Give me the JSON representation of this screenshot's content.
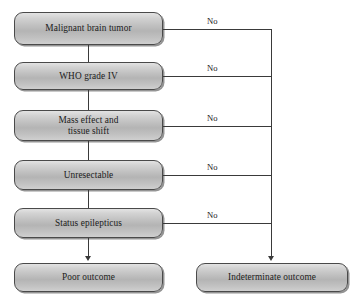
{
  "diagram": {
    "type": "flowchart",
    "canvas": {
      "width": 353,
      "height": 302,
      "background": "#ffffff"
    },
    "style": {
      "node_fill_light": "#e3e3e3",
      "node_fill_mid": "#b4b4b4",
      "node_border": "#4a4a4a",
      "edge_color": "#3a3a3a",
      "text_color": "#1b1b1b"
    },
    "nodes": [
      {
        "id": "n1",
        "label": "Malignant brain tumor",
        "line1": "Malignant brain tumor",
        "line2": ""
      },
      {
        "id": "n2",
        "label": "WHO grade IV",
        "line1": "WHO grade IV",
        "line2": ""
      },
      {
        "id": "n3",
        "label": "Mass effect and tissue shift",
        "line1": "Mass effect and",
        "line2": "tissue shift"
      },
      {
        "id": "n4",
        "label": "Unresectable",
        "line1": "Unresectable",
        "line2": ""
      },
      {
        "id": "n5",
        "label": "Status epilepticus",
        "line1": "Status epilepticus",
        "line2": ""
      },
      {
        "id": "n6",
        "label": "Poor outcome",
        "line1": "Poor outcome",
        "line2": ""
      },
      {
        "id": "n7",
        "label": "Indeterminate outcome",
        "line1": "Indeterminate outcome",
        "line2": ""
      }
    ],
    "branch_labels": [
      {
        "id": "b1",
        "text": "No",
        "from": "n1",
        "to": "n7"
      },
      {
        "id": "b2",
        "text": "No",
        "from": "n2",
        "to": "n7"
      },
      {
        "id": "b3",
        "text": "No",
        "from": "n3",
        "to": "n7"
      },
      {
        "id": "b4",
        "text": "No",
        "from": "n4",
        "to": "n7"
      },
      {
        "id": "b5",
        "text": "No",
        "from": "n5",
        "to": "n7"
      }
    ]
  }
}
